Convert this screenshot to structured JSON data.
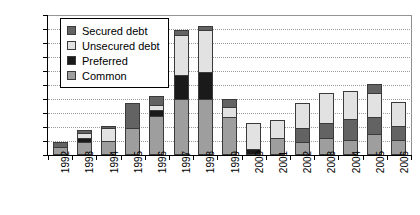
{
  "chart_data": {
    "type": "bar",
    "stacked": true,
    "title": "",
    "subtitle": "",
    "xlabel": "",
    "ylabel": "",
    "ylim": [
      0,
      500
    ],
    "ytick_step": 50,
    "yticks": [
      0,
      50,
      100,
      150,
      200,
      250,
      300,
      350,
      400,
      450,
      500
    ],
    "ytick_labels": [
      "0",
      "50",
      "100",
      "150",
      "200",
      "250",
      "300",
      "350",
      "400",
      "450",
      "500"
    ],
    "grid": true,
    "grid_axis": "y",
    "legend_position": "upper-left-inside",
    "categories": [
      "1992",
      "1993",
      "1994",
      "1995",
      "1996",
      "1997",
      "1998",
      "1999",
      "2000",
      "2001",
      "2002",
      "2003",
      "2004",
      "2005",
      "2006"
    ],
    "series": [
      {
        "name": "Common",
        "color": "#9e9e9e",
        "values": [
          30,
          45,
          50,
          95,
          140,
          200,
          200,
          135,
          0,
          60,
          45,
          60,
          55,
          75,
          55
        ]
      },
      {
        "name": "Preferred",
        "color": "#1a1a1a",
        "values": [
          0,
          15,
          0,
          0,
          20,
          85,
          95,
          0,
          20,
          0,
          0,
          0,
          0,
          0,
          0
        ]
      },
      {
        "name": "Unsecured debt",
        "color": "#e2e2e2",
        "values": [
          0,
          20,
          45,
          0,
          20,
          145,
          150,
          35,
          95,
          65,
          0,
          0,
          0,
          0,
          0
        ]
      },
      {
        "name": "Secured debt",
        "color": "#636363",
        "values": [
          15,
          10,
          10,
          90,
          30,
          15,
          15,
          30,
          0,
          0,
          0,
          0,
          0,
          0,
          0
        ]
      }
    ],
    "stack_details": [
      {
        "year": "1992",
        "segments": [
          {
            "series": "Common",
            "value": 30
          },
          {
            "series": "Secured debt",
            "value": 15
          }
        ],
        "total": 45
      },
      {
        "year": "1993",
        "segments": [
          {
            "series": "Common",
            "value": 45
          },
          {
            "series": "Preferred",
            "value": 15
          },
          {
            "series": "Unsecured debt",
            "value": 20
          },
          {
            "series": "Secured debt",
            "value": 10
          }
        ],
        "total": 90
      },
      {
        "year": "1994",
        "segments": [
          {
            "series": "Common",
            "value": 50
          },
          {
            "series": "Unsecured debt",
            "value": 45
          },
          {
            "series": "Secured debt",
            "value": 10
          }
        ],
        "total": 105
      },
      {
        "year": "1995",
        "segments": [
          {
            "series": "Common",
            "value": 95
          },
          {
            "series": "Secured debt",
            "value": 90
          }
        ],
        "total": 185
      },
      {
        "year": "1996",
        "segments": [
          {
            "series": "Common",
            "value": 140
          },
          {
            "series": "Preferred",
            "value": 20
          },
          {
            "series": "Unsecured debt",
            "value": 20
          },
          {
            "series": "Secured debt",
            "value": 30
          }
        ],
        "total": 210
      },
      {
        "year": "1997",
        "segments": [
          {
            "series": "Common",
            "value": 200
          },
          {
            "series": "Preferred",
            "value": 85
          },
          {
            "series": "Unsecured debt",
            "value": 145
          },
          {
            "series": "Secured debt",
            "value": 15
          }
        ],
        "total": 445
      },
      {
        "year": "1998",
        "segments": [
          {
            "series": "Common",
            "value": 200
          },
          {
            "series": "Preferred",
            "value": 95
          },
          {
            "series": "Unsecured debt",
            "value": 150
          },
          {
            "series": "Secured debt",
            "value": 15
          }
        ],
        "total": 460
      },
      {
        "year": "1999",
        "segments": [
          {
            "series": "Common",
            "value": 135
          },
          {
            "series": "Unsecured debt",
            "value": 35
          },
          {
            "series": "Secured debt",
            "value": 30
          }
        ],
        "total": 200
      },
      {
        "year": "2000",
        "segments": [
          {
            "series": "Preferred",
            "value": 20
          },
          {
            "series": "Unsecured debt",
            "value": 95
          }
        ],
        "total": 115
      },
      {
        "year": "2001",
        "segments": [
          {
            "series": "Common",
            "value": 60
          },
          {
            "series": "Unsecured debt",
            "value": 65
          }
        ],
        "total": 125
      },
      {
        "year": "2002",
        "segments": [
          {
            "series": "Common",
            "value": 45
          },
          {
            "series": "Secured debt",
            "value": 50
          },
          {
            "series": "Unsecured debt",
            "value": 90
          }
        ],
        "total": 185
      },
      {
        "year": "2003",
        "segments": [
          {
            "series": "Common",
            "value": 60
          },
          {
            "series": "Secured debt",
            "value": 55
          },
          {
            "series": "Unsecured debt",
            "value": 105
          }
        ],
        "total": 220
      },
      {
        "year": "2004",
        "segments": [
          {
            "series": "Common",
            "value": 55
          },
          {
            "series": "Secured debt",
            "value": 75
          },
          {
            "series": "Unsecured debt",
            "value": 100
          }
        ],
        "total": 230
      },
      {
        "year": "2005",
        "segments": [
          {
            "series": "Common",
            "value": 75
          },
          {
            "series": "Secured debt",
            "value": 60
          },
          {
            "series": "Unsecured debt",
            "value": 85
          },
          {
            "series": "Secured debt",
            "value": 35
          }
        ],
        "total": 255
      },
      {
        "year": "2006",
        "segments": [
          {
            "series": "Common",
            "value": 55
          },
          {
            "series": "Secured debt",
            "value": 50
          },
          {
            "series": "Unsecured debt",
            "value": 85
          }
        ],
        "total": 190
      }
    ]
  },
  "legend": {
    "items": [
      {
        "label": "Secured debt",
        "color": "#636363"
      },
      {
        "label": "Unsecured debt",
        "color": "#e2e2e2"
      },
      {
        "label": "Preferred",
        "color": "#1a1a1a"
      },
      {
        "label": "Common",
        "color": "#9e9e9e"
      }
    ]
  }
}
